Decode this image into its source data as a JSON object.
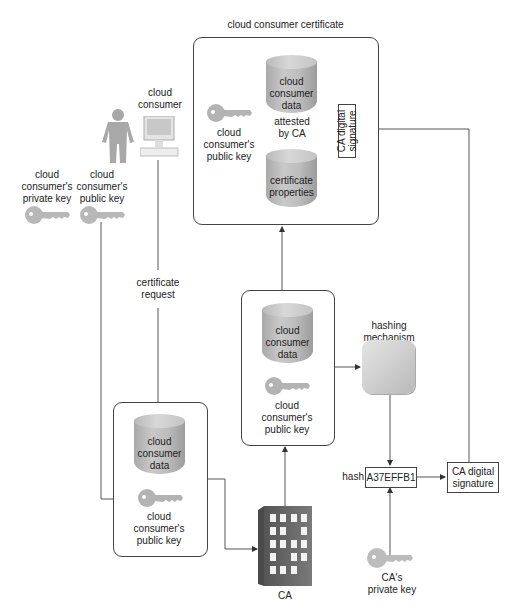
{
  "diagram": {
    "certificate": {
      "title": "cloud consumer certificate",
      "data_cylinder": "cloud\nconsumer\ndata",
      "attested": "attested\nby CA",
      "properties_cylinder": "certificate\nproperties",
      "public_key_label": "cloud\nconsumer's\npublic key",
      "signature_label": "CA digital\nsignature"
    },
    "cloud_consumer": {
      "label": "cloud\nconsumer",
      "private_key_label": "cloud\nconsumer's\nprivate key",
      "public_key_label": "cloud\nconsumer's\npublic key"
    },
    "certificate_request_label": "certificate\nrequest",
    "request_box": {
      "data_cylinder": "cloud\nconsumer\ndata",
      "public_key_label": "cloud\nconsumer's\npublic key"
    },
    "middle_box": {
      "data_cylinder": "cloud\nconsumer\ndata",
      "public_key_label": "cloud\nconsumer's\npublic key"
    },
    "hashing": {
      "label": "hashing\nmechanism"
    },
    "hash": {
      "label": "hash",
      "value": "A37EFFB1"
    },
    "signature_box": {
      "label": "CA digital\nsignature"
    },
    "ca": {
      "label": "CA",
      "private_key_label": "CA's\nprivate key"
    },
    "colors": {
      "line": "#444444",
      "gray_fill": "#bdbdbd",
      "key_fill": "#b5b5b5"
    }
  }
}
